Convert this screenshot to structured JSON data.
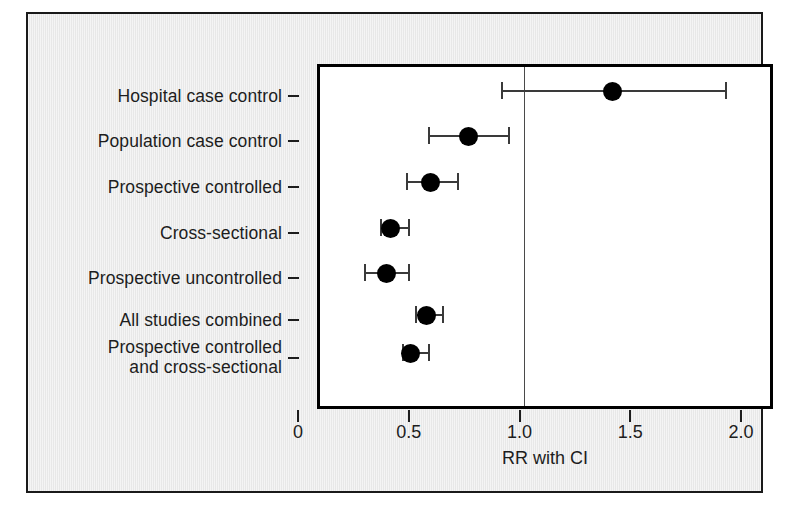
{
  "figure": {
    "background_color": "#e8e8e8",
    "border_color": "#1a1a1a",
    "plot_background_color": "#ffffff",
    "marker_color": "#000000",
    "caption_sliver": ""
  },
  "chart_data": {
    "type": "scatter",
    "subtype": "forest-plot",
    "title": "",
    "xlabel": "RR with CI",
    "ylabel": "",
    "xlim": [
      0,
      2.0
    ],
    "xticks": [
      0,
      0.5,
      1.0,
      1.5,
      2.0
    ],
    "xticklabels": [
      "0",
      "0.5",
      "1.0",
      "1.5",
      "2.0"
    ],
    "grid": false,
    "legend": false,
    "reference_line": 1.0,
    "categories": [
      "Hospital case control",
      "Population case control",
      "Prospective controlled",
      "Cross-sectional",
      "Prospective uncontrolled",
      "All studies combined",
      "Prospective controlled\nand cross-sectional"
    ],
    "values": [
      1.4,
      0.75,
      0.58,
      0.4,
      0.38,
      0.56,
      0.49
    ],
    "ci_low": [
      0.9,
      0.57,
      0.47,
      0.35,
      0.28,
      0.51,
      0.45
    ],
    "ci_high": [
      1.91,
      0.93,
      0.7,
      0.48,
      0.48,
      0.63,
      0.57
    ],
    "points": [
      {
        "label": "Hospital case control",
        "rr": 1.4,
        "ci_low": 0.9,
        "ci_high": 1.91
      },
      {
        "label": "Population case control",
        "rr": 0.75,
        "ci_low": 0.57,
        "ci_high": 0.93
      },
      {
        "label": "Prospective controlled",
        "rr": 0.58,
        "ci_low": 0.47,
        "ci_high": 0.7
      },
      {
        "label": "Cross-sectional",
        "rr": 0.4,
        "ci_low": 0.35,
        "ci_high": 0.48
      },
      {
        "label": "Prospective uncontrolled",
        "rr": 0.38,
        "ci_low": 0.28,
        "ci_high": 0.48
      },
      {
        "label": "All studies combined",
        "rr": 0.56,
        "ci_low": 0.51,
        "ci_high": 0.63
      },
      {
        "label": "Prospective controlled and cross-sectional",
        "rr": 0.49,
        "ci_low": 0.45,
        "ci_high": 0.57
      }
    ]
  }
}
